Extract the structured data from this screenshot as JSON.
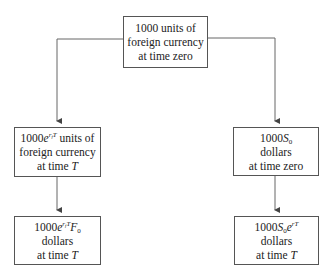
{
  "diagram": {
    "type": "flowchart",
    "nodes": {
      "start": {
        "lines": [
          "1000 units of",
          "foreign currency",
          "at time zero"
        ]
      },
      "left_mid": {
        "line1_prefix": "1000",
        "line1_base": "e",
        "line1_sup": "r",
        "line1_sup_sub": "f",
        "line1_sup_tail": "T",
        "line1_suffix": " units of",
        "line2": "foreign currency",
        "line3_prefix": "at time ",
        "line3_var": "T"
      },
      "left_bottom": {
        "line1_prefix": "1000",
        "line1_base": "e",
        "line1_sup": "r",
        "line1_sup_sub": "f",
        "line1_sup_tail": "T",
        "line1_var": "F",
        "line1_var_sub": "0",
        "line2": "dollars",
        "line3_prefix": "at time ",
        "line3_var": "T"
      },
      "right_mid": {
        "line1_prefix": "1000",
        "line1_var": "S",
        "line1_var_sub": "0",
        "line2": "dollars",
        "line3": "at time zero"
      },
      "right_bottom": {
        "line1_prefix": "1000",
        "line1_var": "S",
        "line1_var_sub": "0",
        "line1_base": "e",
        "line1_sup": "rT",
        "line2": "dollars",
        "line3_prefix": "at time ",
        "line3_var": "T"
      }
    },
    "edges": [
      {
        "from": "start",
        "to": "left_mid"
      },
      {
        "from": "left_mid",
        "to": "left_bottom"
      },
      {
        "from": "start",
        "to": "right_mid"
      },
      {
        "from": "right_mid",
        "to": "right_bottom"
      }
    ],
    "colors": {
      "line": "#555555",
      "text": "#222222",
      "background": "#ffffff"
    }
  }
}
